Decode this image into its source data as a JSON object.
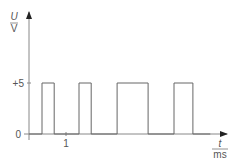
{
  "chart_data": {
    "type": "line",
    "title": "",
    "xlabel": "t / ms",
    "ylabel": "U / V",
    "x_label_numerator": "t",
    "x_label_denominator": "ms",
    "y_label_numerator": "U",
    "y_label_denominator": "V",
    "y_ticks": [
      {
        "value": 0,
        "label": "0"
      },
      {
        "value": 5,
        "label": "+5"
      }
    ],
    "x_ticks": [
      {
        "value": 1,
        "label": "1"
      }
    ],
    "grid": false,
    "legend": null,
    "pulses": [
      {
        "start": 0.35,
        "end": 0.68,
        "level": 5
      },
      {
        "start": 1.35,
        "end": 1.68,
        "level": 5
      },
      {
        "start": 2.38,
        "end": 3.22,
        "level": 5
      },
      {
        "start": 3.92,
        "end": 4.43,
        "level": 5
      }
    ],
    "x": [
      0,
      0.35,
      0.35,
      0.68,
      0.68,
      1.35,
      1.35,
      1.68,
      1.68,
      2.38,
      2.38,
      3.22,
      3.22,
      3.92,
      3.92,
      4.43,
      4.43,
      4.9
    ],
    "values": [
      0,
      0,
      5,
      5,
      0,
      0,
      5,
      5,
      0,
      0,
      5,
      5,
      0,
      0,
      5,
      5,
      0,
      0
    ],
    "xlim": [
      0,
      5.3
    ],
    "ylim": [
      0,
      8
    ],
    "line_color": "#666666"
  }
}
